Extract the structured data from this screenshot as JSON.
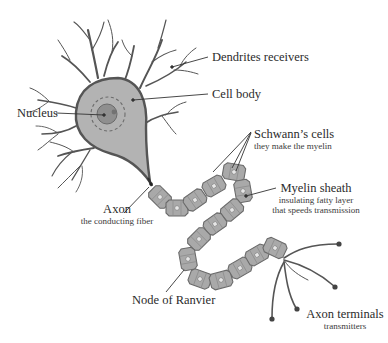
{
  "diagram": {
    "colors": {
      "outline": "#555555",
      "cell_body": "#b3b3b3",
      "nucleus": "#8f8f8f",
      "segment": "#a9a9a9",
      "segment_stroke": "#6a6a6a",
      "leader_line": "#333333"
    },
    "labels": {
      "dendrites": {
        "title": "Dendrites receivers"
      },
      "cell_body": {
        "title": "Cell body"
      },
      "nucleus": {
        "title": "Nucleus"
      },
      "schwann": {
        "title": "Schwann’s cells",
        "subtitle": "they make the myelin"
      },
      "myelin": {
        "title": "Myelin sheath",
        "subtitle_1": "insulating fatty layer",
        "subtitle_2": "that speeds transmission"
      },
      "axon": {
        "title": "Axon",
        "subtitle": "the conducting fiber"
      },
      "node": {
        "title": "Node of Ranvier"
      },
      "terminals": {
        "title": "Axon terminals",
        "subtitle": "transmitters"
      }
    }
  }
}
